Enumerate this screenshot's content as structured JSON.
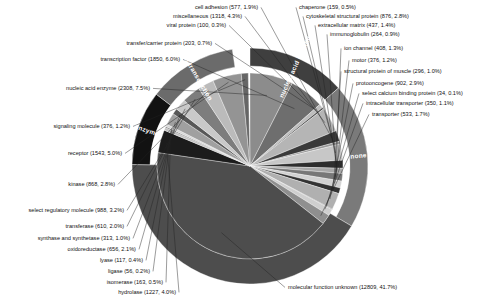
{
  "chart_data": {
    "type": "pie",
    "title": "",
    "subtitle": "",
    "xlabel": "",
    "ylabel": "",
    "legend_position": "none",
    "grid": false,
    "center": {
      "x": 250,
      "y": 166
    },
    "inner_radius": 93,
    "ring_inner_radius": 100,
    "ring_outer_radius": 118,
    "start_angle_deg": -90,
    "direction": "clockwise",
    "total_count": 30719,
    "categories": [
      "molecular function unknown",
      "nucleic acid enzyme",
      "transcription factor",
      "transfer/carrier protein",
      "viral protein",
      "miscellaneous",
      "cell adhesion",
      "chaperone",
      "cytoskeletal structural protein",
      "extracellular matrix",
      "immunoglobulin",
      "ion channel",
      "motor",
      "structural protein of muscle",
      "protooncogene",
      "select calcium binding protein",
      "intracellular transporter",
      "transporter",
      "signaling molecule",
      "receptor",
      "kinase",
      "select regulatory molecule",
      "transferase",
      "synthase and synthetase",
      "oxidoreductase",
      "lyase",
      "ligase",
      "isomerase",
      "hydrolase"
    ],
    "values": [
      12809,
      2308,
      1850,
      203,
      100,
      1318,
      577,
      159,
      876,
      437,
      264,
      408,
      376,
      296,
      902,
      34,
      350,
      533,
      376,
      1543,
      868,
      988,
      610,
      313,
      656,
      117,
      56,
      163,
      1227
    ],
    "percents": [
      41.7,
      7.5,
      6.0,
      0.7,
      0.3,
      4.3,
      1.9,
      0.5,
      2.8,
      1.4,
      0.9,
      1.3,
      1.2,
      1.0,
      2.9,
      0.1,
      1.1,
      1.7,
      1.2,
      5.0,
      2.8,
      3.2,
      2.0,
      1.0,
      2.1,
      0.4,
      0.2,
      0.5,
      4.0
    ],
    "slices": [
      {
        "label": "nucleic acid enzyme",
        "count": 2308,
        "percent": 7.5,
        "text": "nucleic acid enzyme (2308, 7.5%)",
        "color": "#8c8c8c",
        "group": "nucleic acid binding"
      },
      {
        "label": "transcription factor",
        "count": 1850,
        "percent": 6.0,
        "text": "transcription factor (1850, 6.0%)",
        "color": "#6e6e6e",
        "group": "nucleic acid binding"
      },
      {
        "label": "transfer/carrier protein",
        "count": 203,
        "percent": 0.7,
        "text": "transfer/carrier protein (203, 0.7%)",
        "color": "#bdbdbd",
        "group": "none"
      },
      {
        "label": "viral protein",
        "count": 100,
        "percent": 0.3,
        "text": "viral protein (100, 0.3%)",
        "color": "#4a4a4a",
        "group": "none"
      },
      {
        "label": "miscellaneous",
        "count": 1318,
        "percent": 4.3,
        "text": "miscellaneous (1318, 4.3%)",
        "color": "#b5b5b5",
        "group": "none"
      },
      {
        "label": "cell adhesion",
        "count": 577,
        "percent": 1.9,
        "text": "cell adhesion (577, 1.9%)",
        "color": "#3a3a3a",
        "group": "none"
      },
      {
        "label": "chaperone",
        "count": 159,
        "percent": 0.5,
        "text": "chaperone (159, 0.5%)",
        "color": "#9a9a9a",
        "group": "none"
      },
      {
        "label": "cytoskeletal structural protein",
        "count": 876,
        "percent": 2.8,
        "text": "cytoskeletal structural protein (876, 2.8%)",
        "color": "#c7c7c7",
        "group": "none"
      },
      {
        "label": "extracellular matrix",
        "count": 437,
        "percent": 1.4,
        "text": "extracellular matrix (437, 1.4%)",
        "color": "#2e2e2e",
        "group": "none"
      },
      {
        "label": "immunoglobulin",
        "count": 264,
        "percent": 0.9,
        "text": "immunoglobulin (264, 0.9%)",
        "color": "#a8a8a8",
        "group": "none"
      },
      {
        "label": "ion channel",
        "count": 408,
        "percent": 1.3,
        "text": "ion channel (408, 1.3%)",
        "color": "#777777",
        "group": "none"
      },
      {
        "label": "motor",
        "count": 376,
        "percent": 1.2,
        "text": "motor (376, 1.2%)",
        "color": "#d2d2d2",
        "group": "none"
      },
      {
        "label": "structural protein of muscle",
        "count": 296,
        "percent": 1.0,
        "text": "structural protein of muscle (296, 1.0%)",
        "color": "#333333",
        "group": "none"
      },
      {
        "label": "protooncogene",
        "count": 902,
        "percent": 2.9,
        "text": "protooncogene (902, 2.9%)",
        "color": "#b0b0b0",
        "group": "none"
      },
      {
        "label": "select calcium binding protein",
        "count": 34,
        "percent": 0.1,
        "text": "select calcium binding protein (34, 0.1%)",
        "color": "#5c5c5c",
        "group": "none"
      },
      {
        "label": "intracellular transporter",
        "count": 350,
        "percent": 1.1,
        "text": "intracellular transporter (350, 1.1%)",
        "color": "#cfcfcf",
        "group": "none"
      },
      {
        "label": "transporter",
        "count": 533,
        "percent": 1.7,
        "text": "transporter (533, 1.7%)",
        "color": "#8f8f8f",
        "group": "none"
      },
      {
        "label": "molecular function unknown",
        "count": 12809,
        "percent": 41.7,
        "text": "molecular function unknown (12809, 41.7%)",
        "color": "#4d4d4d",
        "group": "none"
      },
      {
        "label": "hydrolase",
        "count": 1227,
        "percent": 4.0,
        "text": "hydrolase (1227, 4.0%)",
        "color": "#1c1c1c",
        "group": "enzyme"
      },
      {
        "label": "isomerase",
        "count": 163,
        "percent": 0.5,
        "text": "isomerase (163, 0.5%)",
        "color": "#c2c2c2",
        "group": "enzyme"
      },
      {
        "label": "ligase",
        "count": 56,
        "percent": 0.2,
        "text": "ligase (56, 0.2%)",
        "color": "#6a6a6a",
        "group": "enzyme"
      },
      {
        "label": "lyase",
        "count": 117,
        "percent": 0.4,
        "text": "lyase (117, 0.4%)",
        "color": "#d6d6d6",
        "group": "enzyme"
      },
      {
        "label": "oxidoreductase",
        "count": 656,
        "percent": 2.1,
        "text": "oxidoreductase (656, 2.1%)",
        "color": "#a0a0a0",
        "group": "enzyme"
      },
      {
        "label": "synthase and synthetase",
        "count": 313,
        "percent": 1.0,
        "text": "synthase and synthetase (313, 1.0%)",
        "color": "#585858",
        "group": "enzyme"
      },
      {
        "label": "transferase",
        "count": 610,
        "percent": 2.0,
        "text": "transferase (610, 2.0%)",
        "color": "#c9c9c9",
        "group": "enzyme"
      },
      {
        "label": "select regulatory molecule",
        "count": 988,
        "percent": 3.2,
        "text": "select regulatory molecule (988, 3.2%)",
        "color": "#7d7d7d",
        "group": "signal transduction"
      },
      {
        "label": "kinase",
        "count": 868,
        "percent": 2.8,
        "text": "kinase (868, 2.8%)",
        "color": "#bbbbbb",
        "group": "signal transduction"
      },
      {
        "label": "receptor",
        "count": 1543,
        "percent": 5.0,
        "text": "receptor (1543, 5.0%)",
        "color": "#949494",
        "group": "signal transduction"
      },
      {
        "label": "signaling molecule",
        "count": 376,
        "percent": 1.2,
        "text": "signaling molecule (376, 1.2%)",
        "color": "#666666",
        "group": "signal transduction"
      }
    ],
    "ring_groups": [
      {
        "label": "nucleic acid binding",
        "percent": 13.5,
        "color": "#3f3f3f",
        "show_label": true
      },
      {
        "label": "none",
        "percent": 20.0,
        "color": "#7a7a7a",
        "show_label": true
      },
      {
        "label": "",
        "percent": 41.7,
        "color": "#4d4d4d",
        "show_label": false
      },
      {
        "label": "enzyme",
        "percent": 10.2,
        "color": "#121212",
        "show_label": true
      },
      {
        "label": "signal transduction",
        "percent": 12.2,
        "color": "#6b6b6b",
        "show_label": true
      }
    ],
    "labels_left": [
      "transcription factor (1850, 6.0%)",
      "nucleic acid enzyme (2308, 7.5%)",
      "signaling molecule (376, 1.2%)",
      "receptor (1543, 5.0%)",
      "kinase (868, 2.8%)",
      "select regulatory molecule (988, 3.2%)",
      "transferase (610, 2.0%)",
      "synthase and synthetase (313, 1.0%)",
      "oxidoreductase (656, 2.1%)",
      "lyase (117, 0.4%)",
      "ligase (56, 0.2%)",
      "isomerase (163, 0.5%)",
      "hydrolase (1227, 4.0%)"
    ],
    "labels_top": [
      "cell adhesion (577, 1.9%)",
      "miscellaneous (1318, 4.3%)",
      "viral protein (100, 0.3%)",
      "transfer/carrier protein (203, 0.7%)"
    ],
    "labels_right": [
      "chaperone (159, 0.5%)",
      "cytoskeletal structural protein (876, 2.8%)",
      "extracellular matrix (437, 1.4%)",
      "immunoglobulin (264, 0.9%)",
      "ion channel (408, 1.3%)",
      "motor (376, 1.2%)",
      "structural protein of muscle (296, 1.0%)",
      "protooncogene (902, 2.9%)",
      "select calcium binding protein (34, 0.1%)",
      "intracellular transporter (350, 1.1%)",
      "transporter (533, 1.7%)"
    ],
    "labels_bottom": [
      "molecular function unknown (12809, 41.7%)"
    ]
  },
  "annotations": {
    "callout_lines": true
  }
}
